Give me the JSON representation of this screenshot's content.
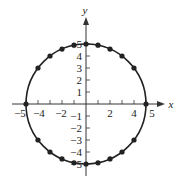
{
  "chart_data": {
    "type": "scatter",
    "title": "",
    "xlabel": "x",
    "ylabel": "y",
    "xlim": [
      -5,
      5
    ],
    "ylim": [
      -5,
      5
    ],
    "grid": false,
    "legend": null,
    "curve": {
      "name": "circle",
      "equation": "x^2 + y^2 = 25",
      "center": [
        0,
        0
      ],
      "radius": 5
    },
    "x_ticks": [
      -5,
      -4,
      -3,
      -2,
      -1,
      1,
      2,
      3,
      4,
      5
    ],
    "x_tick_labels": [
      "-5",
      "-4",
      "-2",
      "2",
      "4",
      "5"
    ],
    "y_ticks": [
      -5,
      -4,
      -3,
      -2,
      -1,
      1,
      2,
      3,
      4,
      5
    ],
    "y_tick_labels": [
      "5",
      "4",
      "3",
      "2",
      "1",
      "-1",
      "-2",
      "-3",
      "-4",
      "-5"
    ],
    "points": [
      {
        "x": -5,
        "y": 0
      },
      {
        "x": -4,
        "y": 3
      },
      {
        "x": -3,
        "y": 4
      },
      {
        "x": -2,
        "y": 4.58
      },
      {
        "x": -1,
        "y": 4.9
      },
      {
        "x": 0,
        "y": 5
      },
      {
        "x": 1,
        "y": 4.9
      },
      {
        "x": 2,
        "y": 4.58
      },
      {
        "x": 3,
        "y": 4
      },
      {
        "x": 4,
        "y": 3
      },
      {
        "x": 5,
        "y": 0
      },
      {
        "x": -4,
        "y": -3
      },
      {
        "x": -3,
        "y": -4
      },
      {
        "x": -2,
        "y": -4.58
      },
      {
        "x": -1,
        "y": -4.9
      },
      {
        "x": 0,
        "y": -5
      },
      {
        "x": 1,
        "y": -4.9
      },
      {
        "x": 2,
        "y": -4.58
      },
      {
        "x": 3,
        "y": -4
      },
      {
        "x": 4,
        "y": -3
      }
    ]
  },
  "style": {
    "curve_color": "#222222",
    "point_color": "#222222",
    "axis_color": "#333333"
  }
}
